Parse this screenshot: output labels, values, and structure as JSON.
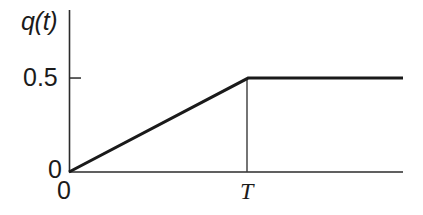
{
  "figure": {
    "width": 423,
    "height": 215,
    "background_color": "#ffffff",
    "ink_color": "#1a1a1a"
  },
  "labels": {
    "ylabel": "q(t)",
    "ytick_half": "0.5",
    "ytick_zero": "0",
    "xtick_zero": "0",
    "xtick_T": "T"
  },
  "chart_data": {
    "type": "line",
    "title": "",
    "xlabel": "",
    "ylabel": "q(t)",
    "grid": false,
    "legend": null,
    "x_tick_labels": [
      "0",
      "T"
    ],
    "x_tick_values": [
      0,
      1
    ],
    "y_tick_labels": [
      "0",
      "0.5"
    ],
    "y_tick_values": [
      0,
      0.5
    ],
    "xlim": [
      0,
      1.865
    ],
    "ylim": [
      0,
      0.862
    ],
    "series": [
      {
        "name": "q(t)",
        "x": [
          0,
          1,
          1.865
        ],
        "values": [
          0,
          0.5,
          0.5
        ],
        "color": "#1a1a1a",
        "linewidth": 3.1
      }
    ],
    "annotations": [
      {
        "name": "T-drop-line",
        "type": "vline",
        "x": 1,
        "y_from": 0,
        "y_to": 0.5,
        "color": "#3a3a3a",
        "linewidth": 1.4
      }
    ]
  }
}
